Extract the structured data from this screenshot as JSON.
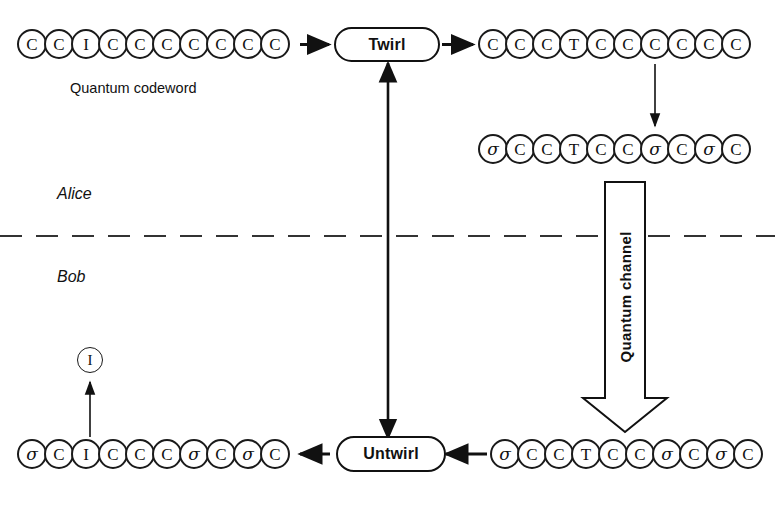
{
  "diagram": {
    "parties": {
      "alice_label": "Alice",
      "bob_label": "Bob"
    },
    "labels": {
      "quantum_codeword": "Quantum codeword",
      "quantum_channel": "Quantum channel"
    },
    "boxes": {
      "twirl": "Twirl",
      "untwirl": "Untwirl"
    },
    "lone_qubit": {
      "symbol": "I"
    },
    "rows": [
      {
        "id": "codeword-row",
        "name": "alice-input-codeword",
        "symbols": [
          "C",
          "C",
          "I",
          "C",
          "C",
          "C",
          "C",
          "C",
          "C",
          "C"
        ]
      },
      {
        "id": "twirled-row",
        "name": "alice-twirled-codeword",
        "symbols": [
          "C",
          "C",
          "C",
          "T",
          "C",
          "C",
          "C",
          "C",
          "C",
          "C"
        ]
      },
      {
        "id": "noisy-alice-row",
        "name": "alice-channel-input",
        "symbols": [
          "σ",
          "C",
          "C",
          "T",
          "C",
          "C",
          "σ",
          "C",
          "σ",
          "C"
        ]
      },
      {
        "id": "noisy-bob-row",
        "name": "bob-channel-output",
        "symbols": [
          "σ",
          "C",
          "C",
          "T",
          "C",
          "C",
          "σ",
          "C",
          "σ",
          "C"
        ]
      },
      {
        "id": "untwirled-row",
        "name": "bob-untwirled-codeword",
        "symbols": [
          "σ",
          "C",
          "I",
          "C",
          "C",
          "C",
          "σ",
          "C",
          "σ",
          "C"
        ]
      }
    ],
    "colors": {
      "ink": "#111111",
      "background": "#ffffff",
      "divider": "#333333"
    }
  }
}
